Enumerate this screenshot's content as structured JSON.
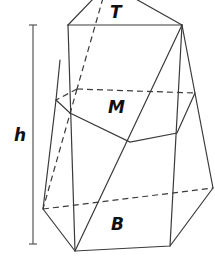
{
  "diagram": {
    "type": "prismatoid",
    "labels": {
      "top": "T",
      "middle": "M",
      "base": "B",
      "height": "h"
    },
    "colors": {
      "line": "#3a3a3a",
      "text": "#111111",
      "background": "#ffffff"
    }
  }
}
